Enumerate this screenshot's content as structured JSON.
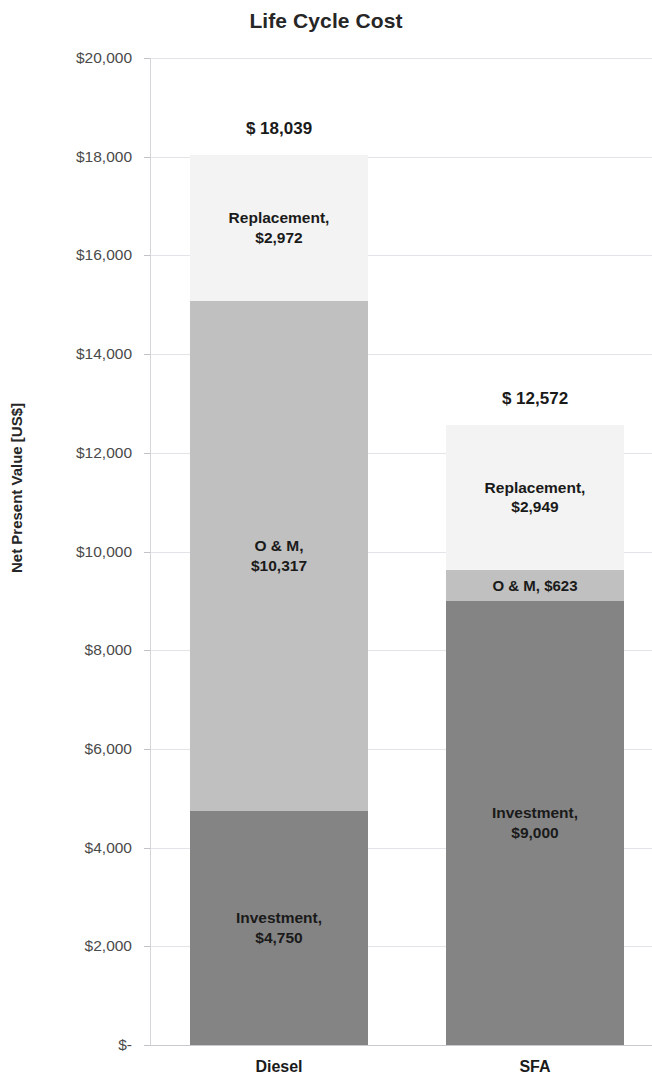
{
  "chart_data": {
    "type": "bar",
    "subtype": "stacked-bar",
    "title": "Life Cycle Cost",
    "xlabel": "",
    "ylabel": "Net Present Value [US$]",
    "ylim": [
      0,
      20000
    ],
    "ytick_values": [
      0,
      2000,
      4000,
      6000,
      8000,
      10000,
      12000,
      14000,
      16000,
      18000,
      20000
    ],
    "ytick_labels": [
      "$-",
      "$2,000",
      "$4,000",
      "$6,000",
      "$8,000",
      "$10,000",
      "$12,000",
      "$14,000",
      "$16,000",
      "$18,000",
      "$20,000"
    ],
    "categories": [
      "Diesel",
      "SFA"
    ],
    "grid": true,
    "grid_axis": "y",
    "legend": "none",
    "stack_order_bottom_to_top": [
      "Investment",
      "O & M",
      "Replacement"
    ],
    "series": [
      {
        "name": "Investment",
        "color": "#848484",
        "values": [
          4750,
          9000
        ],
        "labels": [
          "Investment,|$4,750",
          "Investment,|$9,000"
        ]
      },
      {
        "name": "O & M",
        "color": "#c0c0c0",
        "values": [
          10317,
          623
        ],
        "labels": [
          "O & M,|$10,317",
          "O & M,  $623"
        ]
      },
      {
        "name": "Replacement",
        "color": "#f3f3f3",
        "values": [
          2972,
          2949
        ],
        "labels": [
          "Replacement,|$2,972",
          "Replacement,|$2,949"
        ]
      }
    ],
    "totals": [
      18039,
      12572
    ],
    "total_labels": [
      "$ 18,039",
      "$ 12,572"
    ]
  },
  "colors": {
    "investment": "#848484",
    "om": "#c0c0c0",
    "replacement": "#f3f3f3",
    "gridline": "#e3e3e8",
    "text": "#1a1a1a",
    "tick_text": "#4a4a4a"
  }
}
